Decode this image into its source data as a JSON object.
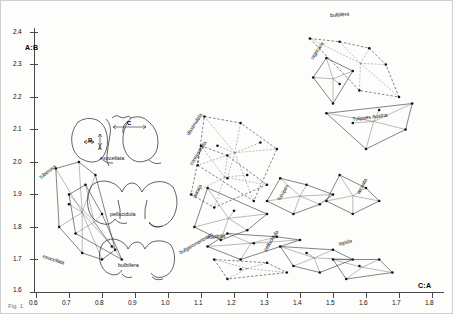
{
  "chart_data": {
    "type": "scatter",
    "title": "",
    "xlabel": "C:A",
    "ylabel": "A:B",
    "xlim": [
      0.6,
      1.8
    ],
    "ylim": [
      1.6,
      2.4
    ],
    "grid": false,
    "legend": "inline-rotated-labels",
    "xticks": [
      "0.6",
      "0.7",
      "0.8",
      "0.9",
      "1.0",
      "1.1",
      "1.2",
      "1.3",
      "1.4",
      "1.5",
      "1.6",
      "1.7",
      "1.8"
    ],
    "yticks": [
      "1.6",
      "1.7",
      "1.8",
      "1.9",
      "2.0",
      "2.1",
      "2.2",
      "2.3",
      "2.4"
    ],
    "series": [
      {
        "name": "tuberosa",
        "label": "tuberosa",
        "style": "solid",
        "points": [
          [
            0.66,
            1.98
          ],
          [
            0.73,
            2.0
          ],
          [
            0.78,
            1.96
          ],
          [
            0.67,
            1.8
          ],
          [
            0.74,
            1.72
          ],
          [
            0.7,
            1.87
          ],
          [
            0.8,
            1.7
          ],
          [
            0.84,
            1.73
          ]
        ]
      },
      {
        "name": "exocellata",
        "label": "exocellata",
        "style": "solid",
        "points": [
          [
            0.75,
            1.93
          ],
          [
            0.8,
            1.84
          ],
          [
            0.83,
            1.74
          ],
          [
            0.86,
            1.7
          ],
          [
            0.72,
            1.78
          ],
          [
            0.7,
            1.9
          ]
        ]
      },
      {
        "name": "dissimulata",
        "label": "dissimulata",
        "style": "dashed",
        "points": [
          [
            1.11,
            2.14
          ],
          [
            1.22,
            2.12
          ],
          [
            1.28,
            2.06
          ],
          [
            1.18,
            1.95
          ],
          [
            1.09,
            1.99
          ],
          [
            1.15,
            2.05
          ],
          [
            1.33,
            2.04
          ],
          [
            1.26,
            1.88
          ]
        ]
      },
      {
        "name": "contaminata",
        "label": "contaminata",
        "style": "dashed",
        "points": [
          [
            1.1,
            2.05
          ],
          [
            1.18,
            2.02
          ],
          [
            1.24,
            1.96
          ],
          [
            1.14,
            1.86
          ],
          [
            1.07,
            1.9
          ],
          [
            1.3,
            1.93
          ]
        ]
      },
      {
        "name": "aurata",
        "label": "aurata",
        "style": "solid",
        "points": [
          [
            1.12,
            1.92
          ],
          [
            1.2,
            1.85
          ],
          [
            1.16,
            1.76
          ],
          [
            1.08,
            1.8
          ],
          [
            1.24,
            1.79
          ],
          [
            1.3,
            1.84
          ]
        ]
      },
      {
        "name": "fulvipes",
        "label": "fulvipes",
        "style": "solid",
        "points": [
          [
            1.34,
            1.95
          ],
          [
            1.42,
            1.93
          ],
          [
            1.38,
            1.84
          ],
          [
            1.46,
            1.87
          ],
          [
            1.3,
            1.88
          ],
          [
            1.5,
            1.9
          ]
        ]
      },
      {
        "name": "nigricans",
        "label": "nigricans",
        "style": "solid",
        "points": [
          [
            1.48,
            2.32
          ],
          [
            1.52,
            2.24
          ],
          [
            1.44,
            2.26
          ],
          [
            1.5,
            2.18
          ],
          [
            1.56,
            2.28
          ]
        ]
      },
      {
        "name": "bulbifera",
        "label": "bulbifera",
        "style": "dashed",
        "points": [
          [
            1.43,
            2.38
          ],
          [
            1.52,
            2.37
          ],
          [
            1.61,
            2.35
          ],
          [
            1.66,
            2.3
          ],
          [
            1.58,
            2.22
          ],
          [
            1.7,
            2.2
          ]
        ]
      },
      {
        "name": "Tulipaes Austria",
        "label": "Tulipaes Austria",
        "style": "solid",
        "points": [
          [
            1.48,
            2.15
          ],
          [
            1.56,
            2.12
          ],
          [
            1.64,
            2.16
          ],
          [
            1.72,
            2.1
          ],
          [
            1.6,
            2.04
          ],
          [
            1.74,
            2.18
          ]
        ]
      },
      {
        "name": "arcuata",
        "label": "arcuata",
        "style": "solid",
        "points": [
          [
            1.52,
            1.96
          ],
          [
            1.6,
            1.92
          ],
          [
            1.56,
            1.84
          ],
          [
            1.64,
            1.88
          ],
          [
            1.48,
            1.88
          ]
        ]
      },
      {
        "name": "instabilis",
        "label": "instabilis",
        "style": "solid",
        "points": [
          [
            1.18,
            1.78
          ],
          [
            1.26,
            1.75
          ],
          [
            1.33,
            1.77
          ],
          [
            1.22,
            1.7
          ],
          [
            1.12,
            1.74
          ],
          [
            1.4,
            1.76
          ]
        ]
      },
      {
        "name": "pellucidula",
        "label": "pellucidula",
        "style": "solid",
        "points": [
          [
            1.34,
            1.74
          ],
          [
            1.42,
            1.72
          ],
          [
            1.5,
            1.73
          ],
          [
            1.38,
            1.68
          ],
          [
            1.56,
            1.7
          ],
          [
            1.46,
            1.66
          ]
        ]
      },
      {
        "name": "bulgaromanorum",
        "label": "bulgaromanorum",
        "style": "dashed",
        "points": [
          [
            1.14,
            1.7
          ],
          [
            1.22,
            1.67
          ],
          [
            1.3,
            1.69
          ],
          [
            1.18,
            1.64
          ],
          [
            1.36,
            1.66
          ]
        ]
      },
      {
        "name": "lepida",
        "label": "lepida",
        "style": "solid",
        "points": [
          [
            1.5,
            1.7
          ],
          [
            1.58,
            1.68
          ],
          [
            1.64,
            1.7
          ],
          [
            1.54,
            1.64
          ],
          [
            1.68,
            1.66
          ]
        ]
      }
    ]
  },
  "axes": {
    "y_label": "A:B",
    "x_label": "C:A",
    "x_ticks": [
      "0.6",
      "0.7",
      "0.8",
      "0.9",
      "1.0",
      "1.1",
      "1.2",
      "1.3",
      "1.4",
      "1.5",
      "1.6",
      "1.7",
      "1.8"
    ],
    "y_ticks": [
      "2.4",
      "2.3",
      "2.2",
      "2.1",
      "2.0",
      "1.9",
      "1.8",
      "1.7",
      "1.6"
    ]
  },
  "insets": [
    {
      "name": "exocellata-inset",
      "label": "exocellata",
      "dims": [
        {
          "key": "A",
          "text": "A"
        },
        {
          "key": "B",
          "text": "B"
        },
        {
          "key": "C",
          "text": "C"
        }
      ]
    },
    {
      "name": "pellucidula-inset",
      "label": "pellucidula",
      "dims": []
    },
    {
      "name": "bulbifera-inset",
      "label": "bulbifera",
      "dims": []
    }
  ],
  "polygon_labels": [
    {
      "name": "tuberosa",
      "text": "tuberosa"
    },
    {
      "name": "exocellata",
      "text": "exocellata"
    },
    {
      "name": "dissimulata",
      "text": "dissimulata"
    },
    {
      "name": "contaminata",
      "text": "contaminata"
    },
    {
      "name": "aurata",
      "text": "aurata"
    },
    {
      "name": "fulvipes",
      "text": "fulvipes"
    },
    {
      "name": "nigricans",
      "text": "nigricans"
    },
    {
      "name": "bulbifera",
      "text": "bulbifera"
    },
    {
      "name": "tulipaes-austria",
      "text": "Tulipaes Austria"
    },
    {
      "name": "arcuata",
      "text": "arcuata"
    },
    {
      "name": "instabilis",
      "text": "instabilis"
    },
    {
      "name": "pellucidula",
      "text": "pellucidula"
    },
    {
      "name": "bulgaromanorum",
      "text": "bulgaromanorum"
    },
    {
      "name": "lepida",
      "text": "lepida"
    }
  ],
  "caption": {
    "text": "Fig. 1"
  },
  "colors": {
    "ink": "#1a1a1a",
    "axis": "#4a4a4a",
    "light": "#999999"
  }
}
